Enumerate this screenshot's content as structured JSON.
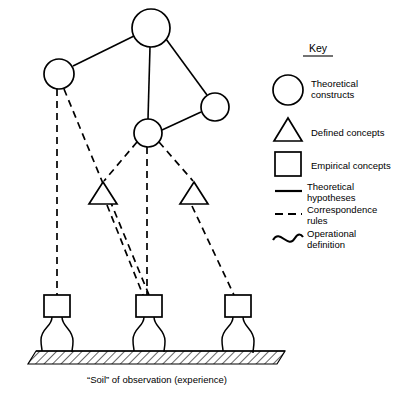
{
  "diagram": {
    "caption": "“Soil” of observation (experience)",
    "key": {
      "title": "Key",
      "entries": [
        {
          "symbol": "circle",
          "label_line1": "Theoretical",
          "label_line2": "constructs"
        },
        {
          "symbol": "triangle",
          "label_line1": "Defined concepts",
          "label_line2": ""
        },
        {
          "symbol": "square",
          "label_line1": "Empirical concepts",
          "label_line2": ""
        },
        {
          "symbol": "solid-line",
          "label_line1": "Theoretical",
          "label_line2": "hypotheses"
        },
        {
          "symbol": "dashed-line",
          "label_line1": "Correspondence",
          "label_line2": "rules"
        },
        {
          "symbol": "wavy-line",
          "label_line1": "Operational",
          "label_line2": "definition"
        }
      ]
    },
    "colors": {
      "ink": "#000000",
      "paper": "#ffffff"
    },
    "nodes": {
      "circles": [
        {
          "id": "top",
          "cx": 151,
          "cy": 28,
          "r": 19
        },
        {
          "id": "left",
          "cx": 59,
          "cy": 74,
          "r": 15
        },
        {
          "id": "right",
          "cx": 215,
          "cy": 107,
          "r": 14
        },
        {
          "id": "center",
          "cx": 148,
          "cy": 133,
          "r": 14
        }
      ],
      "triangles": [
        {
          "id": "left-defined",
          "apex_x": 103,
          "apex_y": 182,
          "half_w": 14,
          "base_y": 204
        },
        {
          "id": "right-defined",
          "apex_x": 194,
          "apex_y": 182,
          "half_w": 14,
          "base_y": 204
        }
      ],
      "squares": [
        {
          "id": "left-empirical",
          "x": 44,
          "y": 295,
          "w": 26,
          "h": 22
        },
        {
          "id": "center-empirical",
          "x": 136,
          "y": 295,
          "w": 26,
          "h": 22
        },
        {
          "id": "right-empirical",
          "x": 225,
          "y": 295,
          "w": 26,
          "h": 22
        }
      ]
    },
    "edges": {
      "theoretical_hypotheses": [
        {
          "from": "top",
          "to": "left"
        },
        {
          "from": "top",
          "to": "center"
        },
        {
          "from": "top",
          "to": "right"
        },
        {
          "from": "right",
          "to": "center"
        }
      ],
      "correspondence_rules": [
        {
          "from": "left",
          "to": "left-empirical"
        },
        {
          "from": "left",
          "to": "center-empirical"
        },
        {
          "from": "center",
          "to": "left-defined"
        },
        {
          "from": "center",
          "to": "center-empirical"
        },
        {
          "from": "center",
          "to": "right-defined"
        },
        {
          "from": "left-defined",
          "to": "left-empirical-lower"
        },
        {
          "from": "right-defined",
          "to": "right-empirical"
        }
      ]
    },
    "ground": {
      "label": "hatched soil band"
    }
  }
}
